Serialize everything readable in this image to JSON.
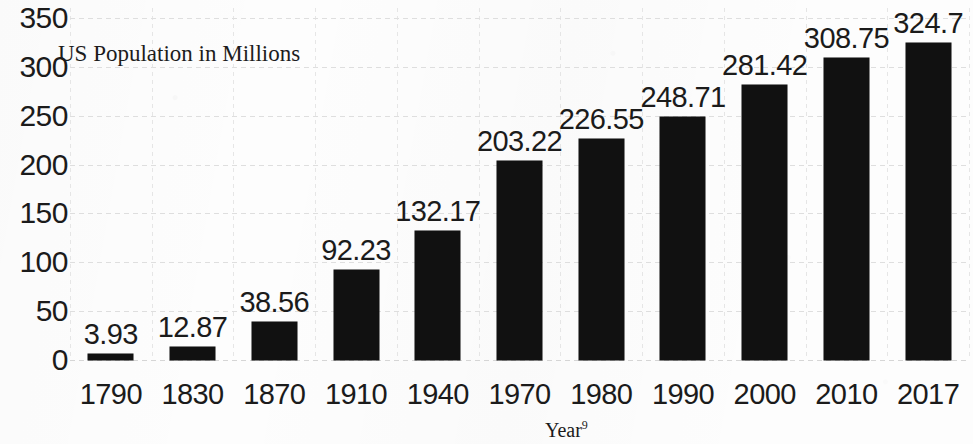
{
  "chart_data": {
    "type": "bar",
    "title": "US Population in Millions",
    "xlabel": "Year",
    "xlabel_superscript": "9",
    "ylabel": "",
    "ylim": [
      0,
      350
    ],
    "ytick_step": 50,
    "grid": true,
    "legend": "none",
    "bar_color": "#111111",
    "categories": [
      "1790",
      "1830",
      "1870",
      "1910",
      "1940",
      "1970",
      "1980",
      "1990",
      "2000",
      "2010",
      "2017"
    ],
    "values": [
      3.93,
      12.87,
      38.56,
      92.23,
      132.17,
      203.22,
      226.55,
      248.71,
      281.42,
      308.75,
      324.7
    ],
    "value_labels": [
      "3.93",
      "12.87",
      "38.56",
      "92.23",
      "132.17",
      "203.22",
      "226.55",
      "248.71",
      "281.42",
      "308.75",
      "324.7"
    ],
    "ytick_labels": [
      "350",
      "300",
      "250",
      "200",
      "150",
      "100",
      "50",
      "0"
    ],
    "ytick_values": [
      350,
      300,
      250,
      200,
      150,
      100,
      50,
      0
    ]
  },
  "axes": {
    "y_ticks": [
      {
        "label": "350",
        "value": 350
      },
      {
        "label": "300",
        "value": 300
      },
      {
        "label": "250",
        "value": 250
      },
      {
        "label": "200",
        "value": 200
      },
      {
        "label": "150",
        "value": 150
      },
      {
        "label": "100",
        "value": 100
      },
      {
        "label": "50",
        "value": 50
      },
      {
        "label": "0",
        "value": 0
      }
    ]
  },
  "labels": {
    "series_title": "US Population in Millions",
    "x_axis_title": "Year",
    "x_axis_title_sup": "9"
  }
}
